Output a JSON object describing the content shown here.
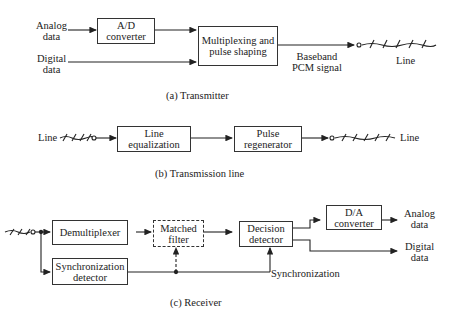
{
  "transmitter": {
    "inputs": {
      "analog": "Analog\ndata",
      "digital": "Digital\ndata"
    },
    "blocks": {
      "ad": "A/D\nconverter",
      "mux": "Multiplexing and\npulse shaping"
    },
    "signal": "Baseband\nPCM signal",
    "line": "Line",
    "caption": "(a) Transmitter"
  },
  "transmission": {
    "line_in": "Line",
    "blocks": {
      "eq": "Line\nequalization",
      "regen": "Pulse\nregenerator"
    },
    "line_out": "Line",
    "caption": "(b) Transmission line"
  },
  "receiver": {
    "blocks": {
      "demux": "Demultiplexer",
      "matched": "Matched\nfilter",
      "decision": "Decision\ndetector",
      "da": "D/A\nconverter",
      "sync": "Synchronization\ndetector"
    },
    "outputs": {
      "analog": "Analog\ndata",
      "digital": "Digital\ndata"
    },
    "sync_label": "Synchronization",
    "caption": "(c) Receiver"
  }
}
